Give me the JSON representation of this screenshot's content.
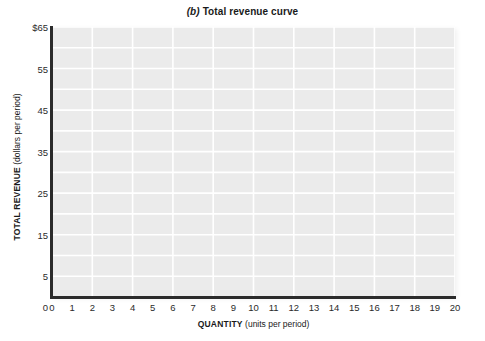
{
  "chart_data": {
    "type": "line",
    "title": "(b) Total revenue curve",
    "title_parts": {
      "panel_letter": "(b)",
      "rest": " Total revenue curve"
    },
    "xlabel_strong": "QUANTITY",
    "xlabel_light": "(units per period)",
    "ylabel_strong": "TOTAL REVENUE",
    "ylabel_light": "(dollars per period)",
    "xlim": [
      0,
      20
    ],
    "ylim": [
      0,
      65
    ],
    "x_ticks": [
      0,
      1,
      2,
      3,
      4,
      5,
      6,
      7,
      8,
      9,
      10,
      11,
      12,
      13,
      14,
      15,
      16,
      17,
      18,
      19,
      20
    ],
    "x_tick_labels": [
      "0",
      "1",
      "2",
      "3",
      "4",
      "5",
      "6",
      "7",
      "8",
      "9",
      "10",
      "11",
      "12",
      "13",
      "14",
      "15",
      "16",
      "17",
      "18",
      "19",
      "20"
    ],
    "y_ticks": [
      5,
      15,
      25,
      35,
      45,
      55,
      65
    ],
    "y_tick_labels": [
      "5",
      "15",
      "25",
      "35",
      "45",
      "55",
      "$65"
    ],
    "y_origin_label": "0",
    "grid": true,
    "grid_color": "#ffffff",
    "grid_x_interval": 2,
    "grid_y_interval": 5,
    "plot_background": "#ebebeb",
    "axis_color": "#2b2b2b",
    "legend": null,
    "series": [],
    "annotations": [],
    "note": "Blank grid template; no data curve is plotted."
  }
}
